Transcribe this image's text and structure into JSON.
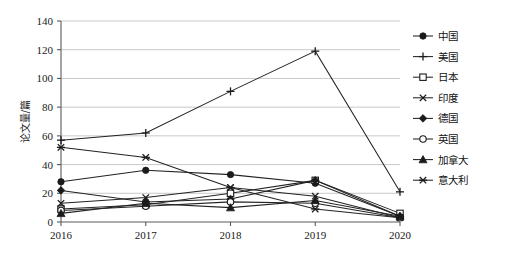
{
  "chart_data": {
    "type": "line",
    "title": "",
    "xlabel": "",
    "ylabel": "论文量/篇",
    "categories": [
      "2016",
      "2017",
      "2018",
      "2019",
      "2020"
    ],
    "x": [
      2016,
      2017,
      2018,
      2019,
      2020
    ],
    "ylim": [
      0,
      140
    ],
    "ytick_step": 20,
    "yticks": [
      "0",
      "20",
      "40",
      "60",
      "80",
      "100",
      "120",
      "140"
    ],
    "grid": "horizontal",
    "legend_position": "right",
    "series": [
      {
        "name": "中国",
        "marker": "filled-circle",
        "values": [
          28,
          36,
          33,
          27,
          4
        ]
      },
      {
        "name": "美国",
        "marker": "plus",
        "values": [
          57,
          62,
          91,
          119,
          21
        ]
      },
      {
        "name": "日本",
        "marker": "open-square",
        "values": [
          9,
          12,
          20,
          29,
          6
        ]
      },
      {
        "name": "印度",
        "marker": "cross-x",
        "values": [
          13,
          17,
          24,
          18,
          3
        ]
      },
      {
        "name": "德国",
        "marker": "filled-diamond",
        "values": [
          22,
          14,
          16,
          29,
          4
        ]
      },
      {
        "name": "英国",
        "marker": "open-circle",
        "values": [
          8,
          11,
          14,
          13,
          3
        ]
      },
      {
        "name": "加拿大",
        "marker": "filled-triangle",
        "values": [
          6,
          13,
          10,
          15,
          4
        ]
      },
      {
        "name": "意大利",
        "marker": "asterisk",
        "values": [
          52,
          45,
          24,
          9,
          3
        ]
      }
    ]
  },
  "colors": {
    "ink": "#1b1b1b",
    "grid": "#c9c9c9",
    "axis": "#5a5a5a",
    "background": "#ffffff"
  }
}
